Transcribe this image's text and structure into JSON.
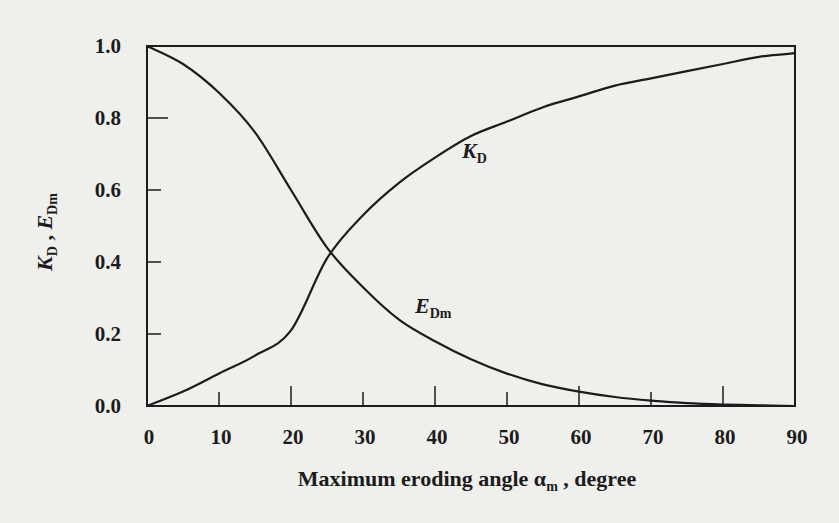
{
  "chart_data": {
    "type": "line",
    "title": "",
    "xlabel": "Maximum eroding angle α_m , degree",
    "xlabel_parts": {
      "main": "Maximum eroding angle ",
      "symbol": "α",
      "subscript": "m",
      "suffix": " , degree"
    },
    "ylabel": "K_D , E_Dm",
    "ylabel_parts": {
      "k": "K",
      "k_sub": "D",
      "sep": " , ",
      "e": "E",
      "e_sub": "Dm"
    },
    "xlim": [
      0,
      90
    ],
    "ylim": [
      0.0,
      1.0
    ],
    "x_ticks": [
      "0",
      "10",
      "20",
      "30",
      "40",
      "50",
      "60",
      "70",
      "80",
      "90"
    ],
    "y_ticks": [
      "0.0",
      "0.2",
      "0.4",
      "0.6",
      "0.8",
      "1.0"
    ],
    "grid": false,
    "legend": "inline labels on curves",
    "x": [
      0,
      5,
      10,
      15,
      20,
      25,
      30,
      35,
      40,
      45,
      50,
      55,
      60,
      65,
      70,
      75,
      80,
      85,
      90
    ],
    "series": [
      {
        "name": "K_D",
        "label_main": "K",
        "label_sub": "D",
        "values": [
          0.0,
          0.04,
          0.09,
          0.14,
          0.21,
          0.41,
          0.53,
          0.62,
          0.69,
          0.75,
          0.79,
          0.83,
          0.86,
          0.89,
          0.91,
          0.93,
          0.95,
          0.97,
          0.98
        ]
      },
      {
        "name": "E_Dm",
        "label_main": "E",
        "label_sub": "Dm",
        "values": [
          1.0,
          0.95,
          0.87,
          0.76,
          0.6,
          0.44,
          0.33,
          0.24,
          0.18,
          0.13,
          0.09,
          0.06,
          0.04,
          0.025,
          0.015,
          0.008,
          0.004,
          0.002,
          0.0
        ]
      }
    ],
    "crossing": {
      "x": 25.4,
      "y": 0.43
    }
  },
  "colors": {
    "background": "#efefec",
    "ink": "#1c1c1c"
  }
}
